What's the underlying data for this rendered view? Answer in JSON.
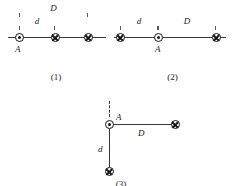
{
  "figure": {
    "marker_symbols": {
      "out_of_page": "current-out-of-page-dot-icon",
      "into_page": "current-into-page-cross-icon"
    },
    "panels": [
      {
        "id": "panel-1",
        "caption": "(1)",
        "point_label": "A",
        "dimensions": [
          {
            "key": "D",
            "label": "D"
          },
          {
            "key": "d",
            "label": "d"
          }
        ],
        "wires": [
          {
            "name": "wire-left-A",
            "symbol": "out_of_page"
          },
          {
            "name": "wire-middle",
            "symbol": "into_page"
          },
          {
            "name": "wire-right",
            "symbol": "into_page"
          }
        ]
      },
      {
        "id": "panel-2",
        "caption": "(2)",
        "point_label": "A",
        "dimensions": [
          {
            "key": "d",
            "label": "d"
          },
          {
            "key": "D",
            "label": "D"
          }
        ],
        "wires": [
          {
            "name": "wire-left",
            "symbol": "into_page"
          },
          {
            "name": "wire-middle-A",
            "symbol": "out_of_page"
          },
          {
            "name": "wire-right",
            "symbol": "into_page"
          }
        ]
      },
      {
        "id": "panel-3",
        "caption": "(3)",
        "point_label": "A",
        "dimensions": [
          {
            "key": "D",
            "label": "D"
          },
          {
            "key": "d",
            "label": "d"
          }
        ],
        "wires": [
          {
            "name": "wire-corner-A",
            "symbol": "out_of_page"
          },
          {
            "name": "wire-right",
            "symbol": "into_page"
          },
          {
            "name": "wire-below",
            "symbol": "into_page"
          }
        ]
      }
    ]
  },
  "colors": {
    "ink": "#141414",
    "line": "#3a3a3a",
    "dimension": "#5a5a5a",
    "background": "#ffffff"
  }
}
